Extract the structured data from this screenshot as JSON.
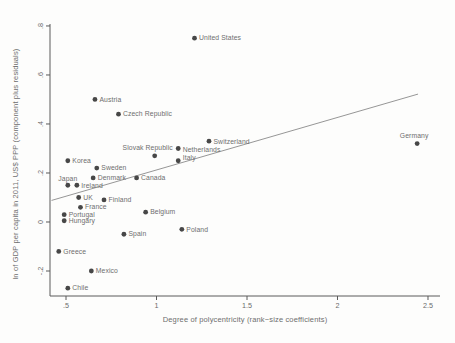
{
  "figure": {
    "background": "#fdfdfc"
  },
  "chart_data": {
    "type": "scatter",
    "title": "",
    "xlabel": "Degree of polycentricity (rank−size coefficients)",
    "ylabel": "ln of GDP per capita in 2011, US$ PPP (component plus residuals)",
    "xlim": [
      0.4116,
      2.5663
    ],
    "ylim": [
      -0.302,
      0.808
    ],
    "grid": false,
    "legend": false,
    "x_ticks": [
      {
        "v": 0.5,
        "label": ".5"
      },
      {
        "v": 1.0,
        "label": "1"
      },
      {
        "v": 1.5,
        "label": "1.5"
      },
      {
        "v": 2.0,
        "label": "2"
      },
      {
        "v": 2.5,
        "label": "2.5"
      }
    ],
    "y_ticks": [
      {
        "v": 0.8,
        "label": ".8"
      },
      {
        "v": 0.6,
        "label": ".6"
      },
      {
        "v": 0.4,
        "label": ".4"
      },
      {
        "v": 0.2,
        "label": ".2"
      },
      {
        "v": 0.0,
        "label": "0"
      },
      {
        "v": -0.2,
        "label": "-.2"
      }
    ],
    "points": [
      {
        "country": "United States",
        "x": 1.21,
        "y": 0.75,
        "lp": "r"
      },
      {
        "country": "Austria",
        "x": 0.66,
        "y": 0.5,
        "lp": "r"
      },
      {
        "country": "Czech Republic",
        "x": 0.79,
        "y": 0.44,
        "lp": "r"
      },
      {
        "country": "Switzerland",
        "x": 1.29,
        "y": 0.33,
        "lp": "r",
        "dy": 1
      },
      {
        "country": "Germany",
        "x": 2.44,
        "y": 0.32,
        "lp": "a",
        "dx": -3
      },
      {
        "country": "Netherlands",
        "x": 1.12,
        "y": 0.3,
        "lp": "r",
        "dy": 1
      },
      {
        "country": "Slovak Republic",
        "x": 0.99,
        "y": 0.27,
        "lp": "a",
        "dx": -7
      },
      {
        "country": "Italy",
        "x": 1.12,
        "y": 0.25,
        "lp": "r",
        "dy": -2.5
      },
      {
        "country": "Korea",
        "x": 0.51,
        "y": 0.25,
        "lp": "r"
      },
      {
        "country": "Sweden",
        "x": 0.67,
        "y": 0.22,
        "lp": "r"
      },
      {
        "country": "Denmark",
        "x": 0.65,
        "y": 0.18,
        "lp": "r"
      },
      {
        "country": "Canada",
        "x": 0.89,
        "y": 0.18,
        "lp": "r"
      },
      {
        "country": "Japan",
        "x": 0.51,
        "y": 0.15,
        "lp": "a",
        "dy": 1.5
      },
      {
        "country": "Ireland",
        "x": 0.56,
        "y": 0.15,
        "lp": "r",
        "dy": 1
      },
      {
        "country": "UK",
        "x": 0.57,
        "y": 0.1,
        "lp": "r"
      },
      {
        "country": "Finland",
        "x": 0.71,
        "y": 0.09,
        "lp": "r"
      },
      {
        "country": "France",
        "x": 0.58,
        "y": 0.06,
        "lp": "r"
      },
      {
        "country": "Belgium",
        "x": 0.94,
        "y": 0.04,
        "lp": "r"
      },
      {
        "country": "Portugal",
        "x": 0.49,
        "y": 0.03,
        "lp": "r"
      },
      {
        "country": "Hungary",
        "x": 0.49,
        "y": 0.005,
        "lp": "r"
      },
      {
        "country": "Poland",
        "x": 1.14,
        "y": -0.03,
        "lp": "r"
      },
      {
        "country": "Spain",
        "x": 0.82,
        "y": -0.05,
        "lp": "r"
      },
      {
        "country": "Greece",
        "x": 0.46,
        "y": -0.12,
        "lp": "r"
      },
      {
        "country": "Mexico",
        "x": 0.64,
        "y": -0.2,
        "lp": "r"
      },
      {
        "country": "Chile",
        "x": 0.51,
        "y": -0.27,
        "lp": "r"
      }
    ],
    "trend_line": {
      "x1": 0.42,
      "y1": 0.088,
      "x2": 2.445,
      "y2": 0.522
    },
    "colors": {
      "dot": "#474747",
      "label": "#6e6e6e",
      "tick_label": "#6b6b6b",
      "axis": "#5a5a5a",
      "trend": "#8a8a8a"
    }
  }
}
